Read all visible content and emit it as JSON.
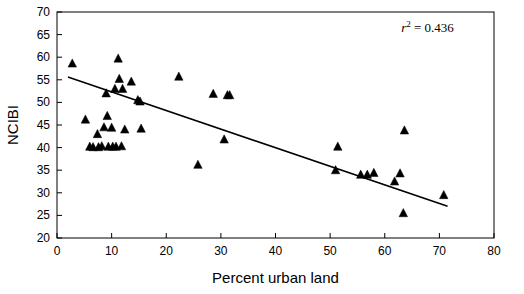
{
  "chart_data": {
    "type": "scatter",
    "title": "",
    "xlabel": "Percent urban land",
    "ylabel": "NCIBI",
    "xlim": [
      0,
      80
    ],
    "ylim": [
      20,
      70
    ],
    "xticks": [
      0,
      10,
      20,
      30,
      40,
      50,
      60,
      70,
      80
    ],
    "yticks": [
      20,
      25,
      30,
      35,
      40,
      45,
      50,
      55,
      60,
      65,
      70
    ],
    "grid": false,
    "legend": "none",
    "marker": "triangle",
    "marker_color": "#000000",
    "annotations": [
      {
        "name": "r-squared",
        "text_prefix": "r",
        "text_sup": "2",
        "text_suffix": " = 0.436",
        "x": 63,
        "y": 65.5
      }
    ],
    "trendline": {
      "type": "linear",
      "x": [
        2.0,
        71.5
      ],
      "y": [
        55.6,
        27.0
      ],
      "color": "#000000"
    },
    "points": [
      {
        "x": 2.8,
        "y": 58.6
      },
      {
        "x": 5.2,
        "y": 46.2
      },
      {
        "x": 6.0,
        "y": 40.2
      },
      {
        "x": 6.6,
        "y": 40.1
      },
      {
        "x": 7.4,
        "y": 43.0
      },
      {
        "x": 7.6,
        "y": 40.1
      },
      {
        "x": 8.2,
        "y": 40.3
      },
      {
        "x": 8.6,
        "y": 44.5
      },
      {
        "x": 9.0,
        "y": 52.0
      },
      {
        "x": 9.2,
        "y": 47.0
      },
      {
        "x": 9.4,
        "y": 40.2
      },
      {
        "x": 10.0,
        "y": 44.4
      },
      {
        "x": 10.2,
        "y": 40.2
      },
      {
        "x": 10.6,
        "y": 53.0
      },
      {
        "x": 10.8,
        "y": 40.2
      },
      {
        "x": 11.2,
        "y": 59.7
      },
      {
        "x": 11.4,
        "y": 55.2
      },
      {
        "x": 11.8,
        "y": 40.3
      },
      {
        "x": 12.0,
        "y": 53.0
      },
      {
        "x": 12.4,
        "y": 44.0
      },
      {
        "x": 13.6,
        "y": 54.6
      },
      {
        "x": 14.8,
        "y": 50.5
      },
      {
        "x": 15.2,
        "y": 50.2
      },
      {
        "x": 15.4,
        "y": 44.2
      },
      {
        "x": 22.3,
        "y": 55.7
      },
      {
        "x": 25.8,
        "y": 36.2
      },
      {
        "x": 28.6,
        "y": 51.9
      },
      {
        "x": 30.6,
        "y": 41.8
      },
      {
        "x": 31.2,
        "y": 51.6
      },
      {
        "x": 31.6,
        "y": 51.6
      },
      {
        "x": 51.0,
        "y": 35.0
      },
      {
        "x": 51.4,
        "y": 40.2
      },
      {
        "x": 55.6,
        "y": 34.0
      },
      {
        "x": 56.8,
        "y": 34.0
      },
      {
        "x": 58.0,
        "y": 34.4
      },
      {
        "x": 61.8,
        "y": 32.5
      },
      {
        "x": 62.8,
        "y": 34.3
      },
      {
        "x": 63.6,
        "y": 43.8
      },
      {
        "x": 63.4,
        "y": 25.5
      },
      {
        "x": 70.8,
        "y": 29.5
      }
    ]
  }
}
